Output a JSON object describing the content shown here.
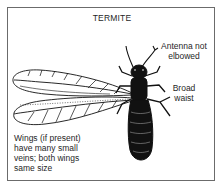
{
  "diagram": {
    "title": "TERMITE",
    "labels": {
      "antenna": [
        "Antenna not",
        "elbowed"
      ],
      "waist": [
        "Broad",
        "waist"
      ],
      "wings": [
        "Wings (if present)",
        "have many small",
        "veins; both wings",
        "same size"
      ]
    },
    "colors": {
      "ink": "#111111",
      "frame": "#6b6b6b",
      "background": "#ffffff"
    },
    "parts": [
      "antennae",
      "head",
      "thorax",
      "legs",
      "wings",
      "abdomen"
    ]
  }
}
